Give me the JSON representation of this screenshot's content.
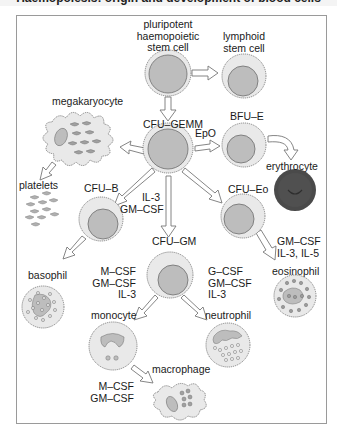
{
  "title": "Haemopoiesis: origin and development of blood cells",
  "colors": {
    "cell_outer": "#e9e9e9",
    "cell_nucleus": "#bdbdbd",
    "cell_outline": "#6d6d6d",
    "erythrocyte": "#4a4a4a",
    "arrow_fill": "#ffffff",
    "arrow_stroke": "#777777",
    "frame": "#9a9a9a"
  },
  "nodes": {
    "pluripotent": {
      "label_line1": "pluripotent",
      "label_line2": "haemopoietic",
      "label_line3": "stem cell"
    },
    "lymphoid": {
      "label_line1": "lymphoid",
      "label_line2": "stem cell"
    },
    "megakaryocyte": {
      "label": "megakaryocyte"
    },
    "platelets": {
      "label": "platelets"
    },
    "cfu_gemm": {
      "label": "CFU–GEMM"
    },
    "bfu_e": {
      "label": "BFU–E"
    },
    "erythrocyte": {
      "label": "erythrocyte"
    },
    "cfu_b": {
      "label": "CFU–B"
    },
    "cfu_eo": {
      "label": "CFU–Eo"
    },
    "cfu_gm": {
      "label": "CFU–GM"
    },
    "basophil": {
      "label": "basophil"
    },
    "eosinophil": {
      "label": "eosinophil"
    },
    "monocyte": {
      "label": "monocyte"
    },
    "neutrophil": {
      "label": "neutrophil"
    },
    "macrophage": {
      "label": "macrophage"
    }
  },
  "factors": {
    "epo": "EpO",
    "gemm_to_gm": {
      "line1": "IL-3",
      "line2": "GM–CSF"
    },
    "eo_to_eosinophil": {
      "line1": "GM–CSF",
      "line2": "IL-3, IL-5"
    },
    "gm_to_monocyte": {
      "line1": "M–CSF",
      "line2": "GM–CSF",
      "line3": "IL-3"
    },
    "gm_to_neutrophil": {
      "line1": "G–CSF",
      "line2": "GM–CSF",
      "line3": "IL-3"
    },
    "monocyte_to_macrophage": {
      "line1": "M–CSF",
      "line2": "GM–CSF"
    }
  }
}
